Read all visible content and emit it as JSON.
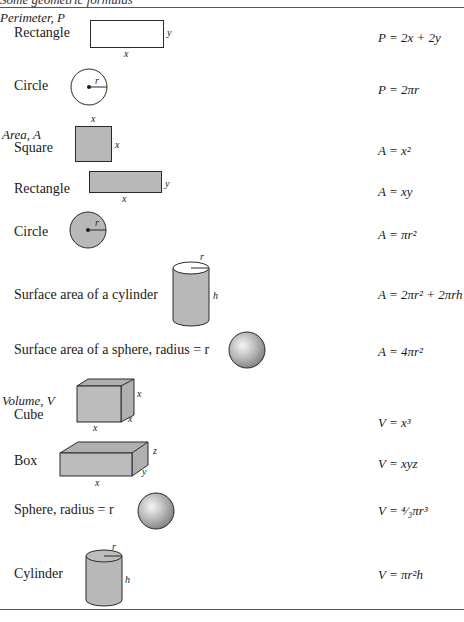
{
  "document": {
    "title": "Some geometric formulas"
  },
  "sections": {
    "perimeter": {
      "heading": "Perimeter, P",
      "rows": [
        {
          "label": "Rectangle",
          "formula": "P = 2x + 2y",
          "figure": "rectangle-outline",
          "dims": {
            "width": "x",
            "height": "y"
          }
        },
        {
          "label": "Circle",
          "formula": "P = 2πr",
          "figure": "circle-outline",
          "dims": {
            "radius": "r"
          }
        }
      ]
    },
    "area": {
      "heading": "Area, A",
      "rows": [
        {
          "label": "Square",
          "formula": "A = x²",
          "figure": "square-filled",
          "dims": {
            "top": "x",
            "side": "x"
          }
        },
        {
          "label": "Rectangle",
          "formula": "A = xy",
          "figure": "rectangle-filled",
          "dims": {
            "width": "x",
            "height": "y"
          }
        },
        {
          "label": "Circle",
          "formula": "A = πr²",
          "figure": "circle-filled",
          "dims": {
            "radius": "r"
          }
        },
        {
          "label": "Surface area of a cylinder",
          "formula": "A = 2πr² + 2πrh",
          "figure": "cylinder",
          "dims": {
            "radius": "r",
            "height": "h"
          }
        },
        {
          "label": "Surface area of a sphere, radius = r",
          "formula": "A = 4πr²",
          "figure": "sphere"
        }
      ]
    },
    "volume": {
      "heading": "Volume, V",
      "rows": [
        {
          "label": "Cube",
          "formula": "V = x³",
          "figure": "cube",
          "dims": {
            "width": "x",
            "height": "x",
            "depth": "x"
          }
        },
        {
          "label": "Box",
          "formula": "V = xyz",
          "figure": "box",
          "dims": {
            "width": "x",
            "depth": "y",
            "height": "z"
          }
        },
        {
          "label": "Sphere, radius = r",
          "formula": "V = ⁴⁄₃πr³",
          "figure": "sphere"
        },
        {
          "label": "Cylinder",
          "formula": "V = πr²h",
          "figure": "cylinder",
          "dims": {
            "radius": "r",
            "height": "h"
          }
        }
      ]
    }
  },
  "colors": {
    "fill": "#b8b8b8",
    "stroke": "#2a2a2a",
    "rule": "#555555"
  }
}
